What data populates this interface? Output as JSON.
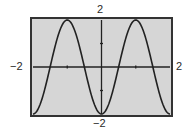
{
  "chart_data": {
    "type": "line",
    "title": "",
    "xlabel": "",
    "ylabel": "",
    "xlim": [
      -2,
      2
    ],
    "ylim": [
      -2,
      2
    ],
    "grid": false,
    "xticks": [
      -1,
      1
    ],
    "yticks": [
      -1,
      1
    ],
    "window_labels": {
      "xmin": "−2",
      "xmax": "2",
      "ymin": "−2",
      "ymax": "2"
    },
    "series": [
      {
        "name": "y = -2cos(πx)",
        "x": [
          -2,
          -1.5,
          -1,
          -0.5,
          0,
          0.5,
          1,
          1.5,
          2
        ],
        "y": [
          -2,
          0,
          2,
          0,
          -2,
          0,
          2,
          0,
          -2
        ]
      }
    ]
  },
  "colors": {
    "background": "#d6d6d6",
    "frame": "#333333",
    "curve": "#222222",
    "axes": "#222222"
  }
}
